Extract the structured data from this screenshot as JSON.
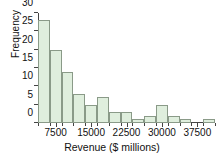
{
  "chart_data": {
    "type": "bar",
    "title": "",
    "xlabel": "Revenue ($ millions)",
    "ylabel": "Frequency",
    "grid": false,
    "legend": "none",
    "bin_width": 2500,
    "bin_start": 3750,
    "categories": [
      "3750-6250",
      "6250-8750",
      "8750-11250",
      "11250-13750",
      "13750-16250",
      "16250-18750",
      "18750-21250",
      "21250-23750",
      "23750-26250",
      "26250-28750",
      "28750-31250",
      "31250-33750",
      "33750-36250",
      "36250-38750",
      "38750-41250"
    ],
    "bin_edges": [
      3750,
      6250,
      8750,
      11250,
      13750,
      16250,
      18750,
      21250,
      23750,
      26250,
      28750,
      31250,
      33750,
      36250,
      38750,
      41250
    ],
    "values": [
      28,
      20,
      14,
      8,
      5,
      7,
      3,
      3,
      1,
      2,
      5,
      2,
      1,
      0,
      1
    ],
    "xlim": [
      3750,
      41250
    ],
    "ylim": [
      0,
      30
    ],
    "xticks": [
      7500,
      15000,
      22500,
      30000,
      37500
    ],
    "xticklabels": [
      "7500",
      "15000",
      "22500",
      "30000",
      "37500"
    ],
    "yticks": [
      0,
      5,
      10,
      15,
      20,
      25,
      30
    ],
    "yticklabels": [
      "0",
      "5",
      "10",
      "15",
      "20",
      "25",
      "30"
    ],
    "bar_color": "#dfeedd",
    "bar_edge_color": "#8a9a88",
    "axis_color": "#444444"
  }
}
